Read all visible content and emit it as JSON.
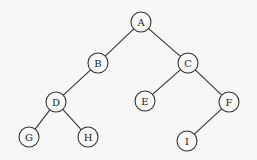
{
  "diagram": {
    "type": "binary-tree",
    "node_radius": 10,
    "colors": {
      "stroke": "#333333",
      "fill": "#f9f9f7",
      "background": "#f7f7f5",
      "text": "#222222"
    },
    "nodes": [
      {
        "id": "A",
        "label": "A",
        "x": 141,
        "y": 22
      },
      {
        "id": "B",
        "label": "B",
        "x": 98,
        "y": 63
      },
      {
        "id": "C",
        "label": "C",
        "x": 188,
        "y": 63
      },
      {
        "id": "D",
        "label": "D",
        "x": 56,
        "y": 102
      },
      {
        "id": "E",
        "label": "E",
        "x": 145,
        "y": 101
      },
      {
        "id": "F",
        "label": "F",
        "x": 229,
        "y": 102
      },
      {
        "id": "G",
        "label": "G",
        "x": 29,
        "y": 137
      },
      {
        "id": "H",
        "label": "H",
        "x": 88,
        "y": 137
      },
      {
        "id": "I",
        "label": "I",
        "x": 187,
        "y": 141
      }
    ],
    "edges": [
      {
        "from": "A",
        "to": "B"
      },
      {
        "from": "A",
        "to": "C"
      },
      {
        "from": "B",
        "to": "D"
      },
      {
        "from": "C",
        "to": "E"
      },
      {
        "from": "C",
        "to": "F"
      },
      {
        "from": "D",
        "to": "G"
      },
      {
        "from": "D",
        "to": "H"
      },
      {
        "from": "F",
        "to": "I"
      }
    ]
  }
}
